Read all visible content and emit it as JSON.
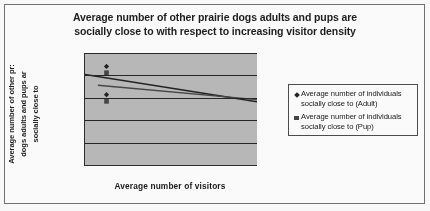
{
  "chart_data": {
    "type": "scatter",
    "title": "Average number of other prairie dogs adults and pups are socially close to with respect to increasing visitor density",
    "title_lines": [
      "Average number of other prairie dogs adults and pups are",
      "socially close to with respect to increasing visitor density"
    ],
    "xlabel": "Average number of visitors",
    "ylabel": "Average number of other prairie dogs adults and pups are socially close to",
    "ylabel_lines": [
      "Average number of other pr:",
      "dogs adults and pups ar",
      "socially close to"
    ],
    "xlim": [
      14,
      22
    ],
    "ylim": [
      0,
      2.5
    ],
    "xticks": [
      14,
      16,
      18,
      20,
      22
    ],
    "xtick_labels": [
      "14",
      "16",
      "18",
      "20",
      "22"
    ],
    "yticks": [
      0,
      0.5,
      1,
      1.5,
      2,
      2.5
    ],
    "ytick_labels": [
      "0",
      "0.5",
      "1",
      "1.5",
      "2",
      "2.5"
    ],
    "grid": true,
    "grid_axis": "y",
    "legend_position": "right",
    "plot_background": "#b9b9b9",
    "series": [
      {
        "name": "Average number of individuals socially close to (Adult)",
        "name_lines": [
          "Average number of individuals",
          "socially close to (Adult)"
        ],
        "marker": "diamond",
        "color": "#1e1e1e",
        "points": [
          {
            "x": 15.0,
            "y": 2.2
          },
          {
            "x": 15.0,
            "y": 1.57
          }
        ],
        "trendline": {
          "x0": 14.0,
          "y0": 2.02,
          "x1": 22.0,
          "y1": 1.41
        }
      },
      {
        "name": "Average number of individuals socially close to (Pup)",
        "name_lines": [
          "Average number of individuals",
          "socially close to (Pup)"
        ],
        "marker": "square",
        "color": "#434343",
        "points": [
          {
            "x": 15.0,
            "y": 2.06
          },
          {
            "x": 15.0,
            "y": 1.42
          }
        ],
        "trendline": {
          "x0": 14.6,
          "y0": 1.78,
          "x1": 22.0,
          "y1": 1.46
        }
      }
    ]
  }
}
